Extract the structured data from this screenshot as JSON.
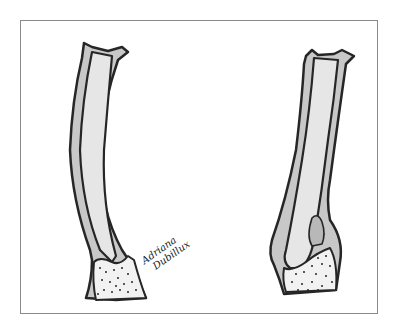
{
  "illustration": {
    "subject": "two tubular structures with base (left: normal, right: with lesion)",
    "colors": {
      "outline": "#262626",
      "wall_fill": "#c8c8c8",
      "lumen_fill": "#e6e6e6",
      "base_fill": "#f2f2f2",
      "frame": "#8a8a8a",
      "background": "#ffffff"
    },
    "left_figure": {
      "name": "normal-tube"
    },
    "right_figure": {
      "name": "tube-with-lesion"
    }
  },
  "signature": {
    "line1": "Adriana",
    "line2": "Dubillux"
  }
}
